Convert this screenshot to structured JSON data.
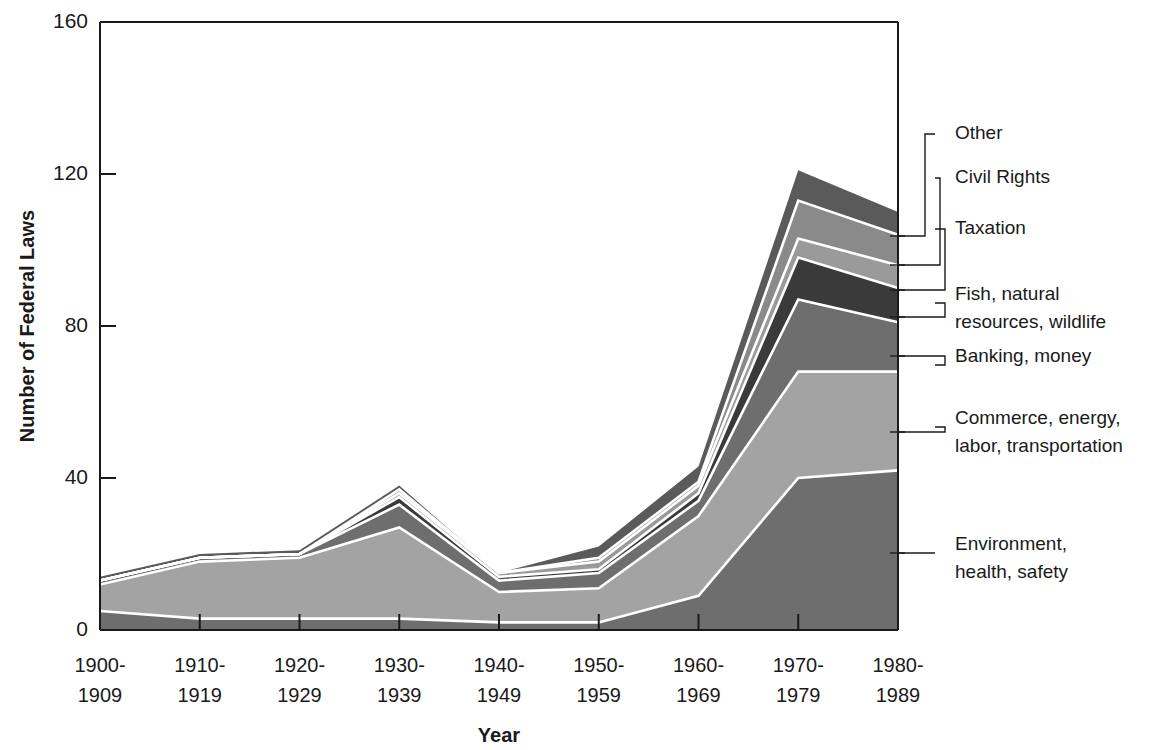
{
  "chart_data": {
    "type": "area",
    "stacked": true,
    "title": "",
    "xlabel": "Year",
    "ylabel": "Number of Federal Laws",
    "ylim": [
      0,
      160
    ],
    "yticks": [
      0,
      40,
      80,
      120,
      160
    ],
    "grid": false,
    "legend_position": "right-callouts",
    "categories": [
      "1900-1909",
      "1910-1919",
      "1920-1929",
      "1930-1939",
      "1940-1949",
      "1950-1959",
      "1960-1969",
      "1970-1979",
      "1980-1989"
    ],
    "category_lines": [
      [
        "1900-",
        "1909"
      ],
      [
        "1910-",
        "1919"
      ],
      [
        "1920-",
        "1929"
      ],
      [
        "1930-",
        "1939"
      ],
      [
        "1940-",
        "1949"
      ],
      [
        "1950-",
        "1959"
      ],
      [
        "1960-",
        "1969"
      ],
      [
        "1970-",
        "1979"
      ],
      [
        "1980-",
        "1989"
      ]
    ],
    "series": [
      {
        "name": "Environment, health, safety",
        "label_lines": [
          "Environment,",
          "health, safety"
        ],
        "color": "#6e6e6e",
        "values": [
          5,
          3,
          3,
          3,
          2,
          2,
          9,
          40,
          42
        ]
      },
      {
        "name": "Commerce, energy, labor, transportation",
        "label_lines": [
          "Commerce, energy,",
          "labor, transportation"
        ],
        "color": "#a3a3a3",
        "values": [
          7,
          15,
          16,
          24,
          8,
          9,
          21,
          28,
          26
        ]
      },
      {
        "name": "Banking, money",
        "label_lines": [
          "Banking, money"
        ],
        "color": "#6e6e6e",
        "values": [
          1,
          1,
          1,
          6,
          3,
          4,
          4,
          19,
          13
        ]
      },
      {
        "name": "Fish, natural resources, wildlife",
        "label_lines": [
          "Fish, natural",
          "resources, wildlife"
        ],
        "color": "#3a3a3a",
        "values": [
          0,
          0,
          0,
          2,
          1,
          1,
          2,
          11,
          9
        ]
      },
      {
        "name": "Taxation",
        "label_lines": [
          "Taxation"
        ],
        "color": "#9a9a9a",
        "values": [
          0,
          0,
          0,
          1,
          1,
          2,
          2,
          5,
          6
        ]
      },
      {
        "name": "Civil Rights",
        "label_lines": [
          "Civil Rights"
        ],
        "color": "#8a8a8a",
        "values": [
          0,
          0,
          0,
          1,
          0,
          1,
          1,
          10,
          8
        ]
      },
      {
        "name": "Other",
        "label_lines": [
          "Other"
        ],
        "color": "#5a5a5a",
        "values": [
          1,
          1,
          1,
          1,
          0,
          3,
          4,
          8,
          6
        ]
      }
    ],
    "totals": [
      14,
      20,
      21,
      38,
      15,
      22,
      43,
      121,
      110
    ]
  },
  "axis": {
    "y_title": "Number of Federal Laws",
    "x_title": "Year",
    "y_tick_labels": [
      "160",
      "120",
      "80",
      "40",
      "0"
    ]
  },
  "legend": {
    "callouts": [
      {
        "name": "Other",
        "lines": [
          "Other"
        ]
      },
      {
        "name": "Civil Rights",
        "lines": [
          "Civil Rights"
        ]
      },
      {
        "name": "Taxation",
        "lines": [
          "Taxation"
        ]
      },
      {
        "name": "Fish, natural resources, wildlife",
        "lines": [
          "Fish, natural",
          "resources, wildlife"
        ]
      },
      {
        "name": "Banking, money",
        "lines": [
          "Banking, money"
        ]
      },
      {
        "name": "Commerce, energy, labor, transportation",
        "lines": [
          "Commerce, energy,",
          "labor, transportation"
        ]
      },
      {
        "name": "Environment, health, safety",
        "lines": [
          "Environment,",
          "health, safety"
        ]
      }
    ]
  },
  "colors": {
    "axis": "#1a1a1a",
    "separator": "#ffffff",
    "background": "#ffffff"
  }
}
